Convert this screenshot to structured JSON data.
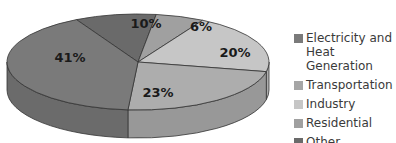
{
  "chart_data": {
    "type": "pie",
    "title": "",
    "style": "3d",
    "categories": [
      "Electricity and Heat Generation",
      "Transportation",
      "Industry",
      "Residential",
      "Other"
    ],
    "values": [
      41,
      23,
      20,
      6,
      10
    ],
    "labels": [
      "41%",
      "23%",
      "20%",
      "6%",
      "10%"
    ],
    "colors": [
      "#7a7a7a",
      "#adadad",
      "#c6c6c6",
      "#a0a0a0",
      "#6a6a6a"
    ],
    "legend_position": "right"
  },
  "legend": {
    "items": [
      {
        "label": "Electricity and Heat Generation",
        "color": "#7a7a7a"
      },
      {
        "label": "Transportation",
        "color": "#a6a6a6"
      },
      {
        "label": "Industry",
        "color": "#c6c6c6"
      },
      {
        "label": "Residential",
        "color": "#a0a0a0"
      },
      {
        "label": "Other",
        "color": "#6a6a6a"
      }
    ]
  }
}
